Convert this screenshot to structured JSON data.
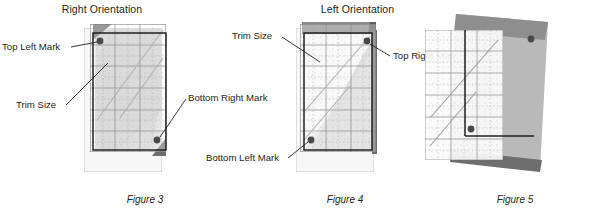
{
  "figures": [
    {
      "id": "figure-3",
      "heading": "Right Orientation",
      "caption": "Figure 3",
      "labels": {
        "top_left_mark": "Top Left Mark",
        "trim_size": "Trim Size",
        "bottom_right_mark": "Bottom Right Mark"
      },
      "marks": [
        "top-left",
        "bottom-right"
      ]
    },
    {
      "id": "figure-4",
      "heading": "Left Orientation",
      "caption": "Figure 4",
      "labels": {
        "trim_size": "Trim Size",
        "top_right_mark": "Top Right Mark",
        "bottom_left_mark": "Bottom Left Mark"
      },
      "marks": [
        "top-right",
        "bottom-left"
      ]
    },
    {
      "id": "figure-5",
      "heading": "",
      "caption": "Figure 5",
      "labels": {},
      "marks": [
        "top-right",
        "bottom-left"
      ]
    }
  ],
  "colors": {
    "ink": "#231f20",
    "fabric_light": "#e9e9e9",
    "fabric_mid": "#c9c9c9",
    "fabric_dark": "#a8a8a8",
    "ruler_fill": "#f2f2f2",
    "ruler_edge": "#8c8c8c",
    "grid_line": "#9a9a9a",
    "mark_dot": "#4a4a4a",
    "shadow": "#6e6e6e",
    "leader": "#231f20"
  },
  "ruler": {
    "grid_major_count_x": 3,
    "grid_major_count_y": 6,
    "tick_style": "dotted",
    "diagonal_lines": 2
  }
}
